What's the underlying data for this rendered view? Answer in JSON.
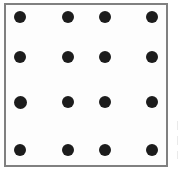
{
  "figure": {
    "type": "dot-grid",
    "background_color": "#ffffff",
    "panel": {
      "x": 4,
      "y": 3,
      "width": 164,
      "height": 164,
      "fill_color": "#fdfdfd",
      "border_color": "#808080",
      "border_width": 2
    },
    "dot": {
      "color": "#1c1c1c",
      "diameter": 12,
      "shape": "circle"
    },
    "grid": {
      "rows": 4,
      "columns": 4,
      "row_centers_y": [
        17,
        57,
        102,
        150
      ],
      "column_centers_x": [
        20,
        68,
        105,
        152
      ],
      "total_dots": 16
    },
    "dots": [
      {
        "label": "dot-r1c1",
        "row": 1,
        "column": 1,
        "cx": 20,
        "cy": 17,
        "diameter": 12
      },
      {
        "label": "dot-r1c2",
        "row": 1,
        "column": 2,
        "cx": 68,
        "cy": 17,
        "diameter": 12
      },
      {
        "label": "dot-r1c3",
        "row": 1,
        "column": 3,
        "cx": 105,
        "cy": 17,
        "diameter": 12
      },
      {
        "label": "dot-r1c4",
        "row": 1,
        "column": 4,
        "cx": 152,
        "cy": 17,
        "diameter": 12
      },
      {
        "label": "dot-r2c1",
        "row": 2,
        "column": 1,
        "cx": 20,
        "cy": 57,
        "diameter": 12
      },
      {
        "label": "dot-r2c2",
        "row": 2,
        "column": 2,
        "cx": 68,
        "cy": 57,
        "diameter": 12
      },
      {
        "label": "dot-r2c3",
        "row": 2,
        "column": 3,
        "cx": 105,
        "cy": 57,
        "diameter": 12
      },
      {
        "label": "dot-r2c4",
        "row": 2,
        "column": 4,
        "cx": 152,
        "cy": 57,
        "diameter": 12
      },
      {
        "label": "dot-r3c1",
        "row": 3,
        "column": 1,
        "cx": 20,
        "cy": 102,
        "diameter": 13
      },
      {
        "label": "dot-r3c2",
        "row": 3,
        "column": 2,
        "cx": 68,
        "cy": 102,
        "diameter": 12
      },
      {
        "label": "dot-r3c3",
        "row": 3,
        "column": 3,
        "cx": 105,
        "cy": 102,
        "diameter": 12
      },
      {
        "label": "dot-r3c4",
        "row": 3,
        "column": 4,
        "cx": 152,
        "cy": 102,
        "diameter": 12
      },
      {
        "label": "dot-r4c1",
        "row": 4,
        "column": 1,
        "cx": 20,
        "cy": 150,
        "diameter": 12
      },
      {
        "label": "dot-r4c2",
        "row": 4,
        "column": 2,
        "cx": 68,
        "cy": 150,
        "diameter": 12
      },
      {
        "label": "dot-r4c3",
        "row": 4,
        "column": 3,
        "cx": 105,
        "cy": 150,
        "diameter": 12
      },
      {
        "label": "dot-r4c4",
        "row": 4,
        "column": 4,
        "cx": 152,
        "cy": 150,
        "diameter": 12
      }
    ],
    "edge_artifacts": [
      {
        "label": "artifact-mark-1",
        "x": 177,
        "y": 121,
        "width": 1,
        "height": 9
      },
      {
        "label": "artifact-mark-2",
        "x": 177,
        "y": 136,
        "width": 1,
        "height": 9
      },
      {
        "label": "artifact-mark-3",
        "x": 177,
        "y": 151,
        "width": 1,
        "height": 8
      }
    ]
  }
}
